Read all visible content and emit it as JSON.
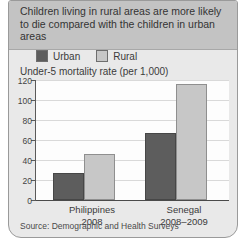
{
  "header": {
    "title": "Children living in rural areas are more likely to die compared with the children in urban areas"
  },
  "chart_data": {
    "type": "bar",
    "axis_title": "Under-5 mortality rate (per 1,000)",
    "categories": [
      {
        "line1": "Philippines",
        "line2": "2008"
      },
      {
        "line1": "Senegal",
        "line2": "2008–2009"
      }
    ],
    "series": [
      {
        "name": "Urban",
        "color": "#5d5d5d",
        "values": [
          27,
          67
        ]
      },
      {
        "name": "Rural",
        "color": "#c7c7c7",
        "values": [
          46,
          116
        ]
      }
    ],
    "ylim": [
      0,
      120
    ],
    "ytick_step": 20,
    "grid": true,
    "legend_position": "top-left"
  },
  "footer": {
    "source": "Source: Demographic and Health Surveys"
  },
  "colors": {
    "title_band": "#c3c3c3",
    "card_body": "#e9e9e9",
    "plot_bg": "#fdfdfd",
    "grid": "#d9d9d9",
    "axis": "#5a5a5a",
    "text": "#3b3b3b"
  }
}
